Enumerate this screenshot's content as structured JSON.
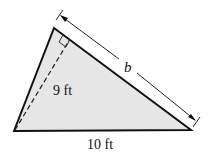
{
  "figure": {
    "type": "triangle",
    "vertices": {
      "left": [
        14,
        131
      ],
      "top": [
        54,
        28
      ],
      "right": [
        191,
        130
      ]
    },
    "fill_color": "#e6e6e6",
    "stroke_color": "#111111",
    "labels": {
      "height": "9 ft",
      "base": "10 ft",
      "side": "b"
    },
    "height_line": "dashed altitude from left vertex perpendicular to side b",
    "right_angle_marker": true,
    "dimension_arrow": "double-headed arrow parallel to side b"
  }
}
